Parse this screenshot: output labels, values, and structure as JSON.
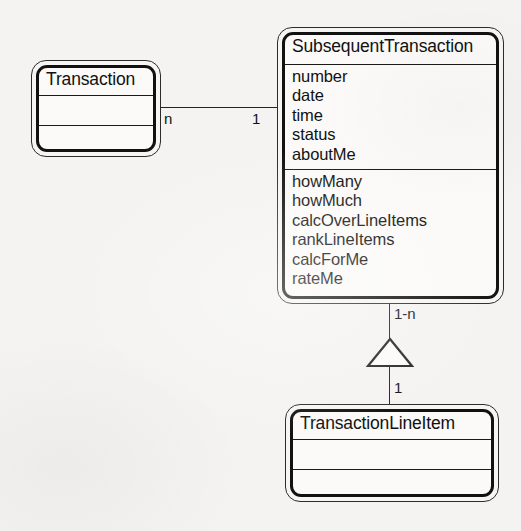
{
  "diagram": {
    "background_color": "#f4f3f1",
    "ink_color": "#111111"
  },
  "classes": [
    {
      "id": "transaction",
      "name": "Transaction",
      "attributes": [],
      "operations": []
    },
    {
      "id": "subsequent_transaction",
      "name": "SubsequentTransaction",
      "attributes": [
        "number",
        "date",
        "time",
        "status",
        "aboutMe"
      ],
      "operations": [
        "howMany",
        "howMuch",
        "calcOverLineItems",
        "rankLineItems",
        "calcForMe",
        "rateMe"
      ]
    },
    {
      "id": "transaction_line_item",
      "name": "TransactionLineItem",
      "attributes": [],
      "operations": []
    }
  ],
  "relationships": [
    {
      "id": "assoc-transaction-subsequent",
      "type": "association",
      "source": "transaction",
      "target": "subsequent_transaction",
      "source_multiplicity": "n",
      "target_multiplicity": "1"
    },
    {
      "id": "aggregation-subsequent-lineitem",
      "type": "aggregation",
      "source": "subsequent_transaction",
      "target": "transaction_line_item",
      "source_multiplicity": "1-n",
      "target_multiplicity": "1"
    }
  ]
}
